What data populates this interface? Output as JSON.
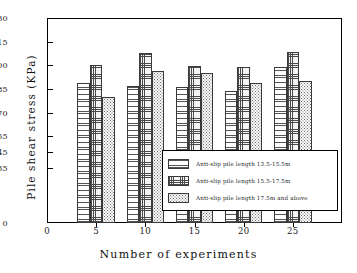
{
  "chart_data": {
    "type": "bar",
    "title": "",
    "xlabel": "Number of experiments",
    "ylabel": "Pile shear stress (KPa)",
    "categories": [
      "5",
      "10",
      "15",
      "20",
      "25"
    ],
    "x_tick_labels": [
      "0",
      "5",
      "10",
      "15",
      "20",
      "25"
    ],
    "y_tick_labels": [
      "0",
      "35",
      "45",
      "55",
      "70",
      "85",
      "100",
      "115",
      "130"
    ],
    "ylim": [
      0,
      130
    ],
    "grid": false,
    "legend_position": "inside-lower-right",
    "series": [
      {
        "name": "Anti-slip pile length 13.5-15.5m",
        "pattern": "horizontal-lines",
        "values": [
          89,
          87,
          86,
          84,
          99
        ]
      },
      {
        "name": "Anti-slip pile length 15.5-17.5m",
        "pattern": "cross-hatch",
        "values": [
          100,
          107.5,
          99.5,
          99,
          108.5
        ]
      },
      {
        "name": "Anti-slip pile length 17.5m and above",
        "pattern": "dotted",
        "values": [
          80,
          96.5,
          95,
          89,
          90
        ]
      }
    ]
  },
  "axes": {
    "y_title": "Pile shear stress (KPa)",
    "x_title": "Number of experiments"
  }
}
